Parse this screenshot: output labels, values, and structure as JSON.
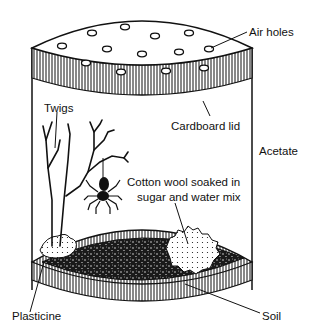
{
  "diagram": {
    "labels": {
      "air_holes": "Air holes",
      "cardboard_lid": "Cardboard lid",
      "acetate": "Acetate",
      "twigs": "Twigs",
      "cotton_wool_line1": "Cotton wool soaked in",
      "cotton_wool_line2": "sugar and water mix",
      "plasticine": "Plasticine",
      "soil": "Soil"
    },
    "colors": {
      "ink": "#111111",
      "background": "#ffffff"
    }
  }
}
